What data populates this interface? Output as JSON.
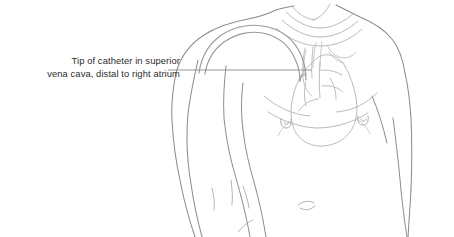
{
  "figure": {
    "type": "medical-line-illustration",
    "width": 454,
    "height": 237,
    "background_color": "#ffffff"
  },
  "annotation": {
    "line1": "Tip of catheter in superior",
    "line2": "vena cava, distal to right atrium",
    "text_color": "#2b2b2b",
    "leader_line_color": "#8a8a8a",
    "leader_line": {
      "x1": 168,
      "y1": 70,
      "x2": 312,
      "y2": 70
    }
  },
  "anatomy": {
    "body_outline_color": "#8c8c8c",
    "internal_organ_color": "#b9b9b9",
    "catheter_color": "#9a9a9a",
    "parts": [
      {
        "name": "torso-outline",
        "label": "Torso and shoulders"
      },
      {
        "name": "left-arm",
        "label": "Left arm"
      },
      {
        "name": "right-arm",
        "label": "Right arm"
      },
      {
        "name": "neck-clavicle",
        "label": "Neck and clavicles"
      },
      {
        "name": "left-nipple",
        "label": "Left nipple"
      },
      {
        "name": "right-nipple",
        "label": "Right nipple"
      },
      {
        "name": "navel",
        "label": "Navel"
      },
      {
        "name": "heart",
        "label": "Heart"
      },
      {
        "name": "superior-vena-cava",
        "label": "Superior vena cava"
      },
      {
        "name": "aortic-arch",
        "label": "Aortic arch"
      },
      {
        "name": "catheter-tube",
        "label": "Central venous catheter"
      },
      {
        "name": "catheter-tip",
        "label": "Catheter tip in superior vena cava"
      }
    ]
  }
}
